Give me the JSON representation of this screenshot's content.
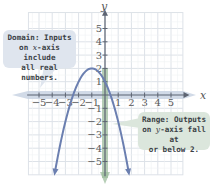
{
  "chart_data": {
    "type": "line",
    "title": "",
    "xlabel": "x",
    "ylabel": "y",
    "xlim": [
      -5.8,
      5.9
    ],
    "ylim": [
      -6.0,
      6.2
    ],
    "grid": true,
    "x_ticks": [
      "-5",
      "-4",
      "-3",
      "-2",
      "-1",
      "1",
      "2",
      "3",
      "4",
      "5"
    ],
    "y_ticks": [
      "5",
      "4",
      "3",
      "2",
      "1",
      "-1",
      "-2",
      "-3",
      "-4",
      "-5"
    ],
    "series": [
      {
        "name": "parabola y = -(x+1)^2 + 2",
        "color": "#6b7fb0",
        "x": [
          -3.8,
          -3.5,
          -3,
          -2.5,
          -2,
          -1.5,
          -1,
          -0.5,
          0,
          0.5,
          1,
          1.5,
          1.8
        ],
        "values": [
          -5.84,
          -4.25,
          -2,
          -0.25,
          1,
          1.75,
          2,
          1.75,
          1,
          -0.25,
          -2,
          -4.25,
          -5.84
        ]
      }
    ],
    "vertex": [
      -1,
      2
    ],
    "y_intercept": 1,
    "x_intercepts": [
      -2.41,
      0.41
    ],
    "annotations": [
      {
        "id": "domain",
        "text": "Domain: Inputs on x-axis include all real numbers.",
        "color": "#dfe5ee",
        "highlights": "x-axis"
      },
      {
        "id": "range",
        "text": "Range: Outputs on y-axis fall at or below 2.",
        "color": "#dbe6dc",
        "highlights": "y-axis at or below 2"
      }
    ]
  },
  "labels": {
    "x_axis": "x",
    "y_axis": "y",
    "domain": {
      "line1": "Domain: Inputs",
      "line2_pre": "on ",
      "line2_var": "x",
      "line2_post": "-axis include",
      "line3": "all real numbers."
    },
    "range": {
      "line1": "Range: Outputs",
      "line2_pre": "on ",
      "line2_var": "y",
      "line2_post": "-axis fall at",
      "line3": "or below 2."
    }
  },
  "colors": {
    "grid": "#dde2e8",
    "axis": "#5d6472",
    "curve": "#6b7fb0",
    "domain_highlight": "#b9c7dc",
    "range_highlight": "#8fb38f"
  }
}
